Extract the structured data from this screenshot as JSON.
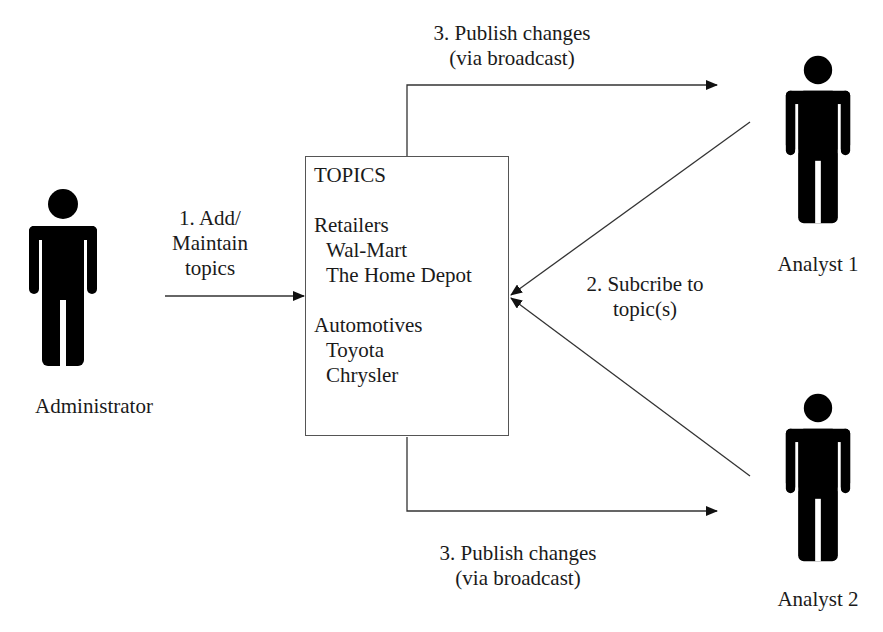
{
  "diagram": {
    "topics_box": {
      "title": "TOPICS",
      "groups": [
        {
          "name": "Retailers",
          "items": [
            "Wal-Mart",
            "The Home Depot"
          ]
        },
        {
          "name": "Automotives",
          "items": [
            "Toyota",
            "Chrysler"
          ]
        }
      ]
    },
    "actors": {
      "administrator": {
        "label": "Administrator",
        "icon": "person-icon"
      },
      "analyst1": {
        "label": "Analyst 1",
        "icon": "person-icon"
      },
      "analyst2": {
        "label": "Analyst 2",
        "icon": "person-icon"
      }
    },
    "edges": {
      "add_maintain": {
        "line1": "1. Add/",
        "line2": "Maintain",
        "line3": "topics"
      },
      "subscribe": {
        "line1": "2. Subcribe to",
        "line2": "topic(s)"
      },
      "publish_top": {
        "line1": "3. Publish changes",
        "line2": "(via broadcast)"
      },
      "publish_bottom": {
        "line1": "3. Publish changes",
        "line2": "(via broadcast)"
      }
    },
    "colors": {
      "line": "#333333",
      "figure": "#000000",
      "text": "#1a1a1a"
    }
  }
}
